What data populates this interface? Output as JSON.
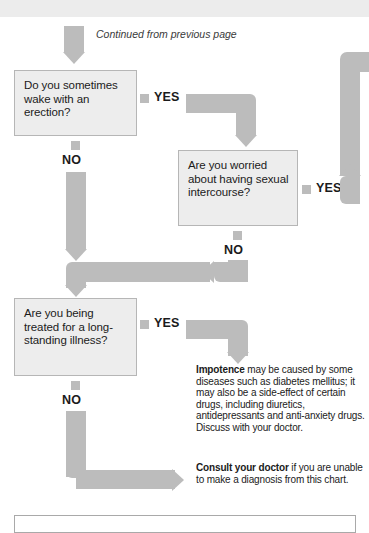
{
  "page": {
    "continued_note": "Continued from previous page"
  },
  "questions": [
    {
      "id": "wake-erection",
      "text": "Do you sometimes wake with an erection?",
      "yes_label": "YES",
      "no_label": "NO"
    },
    {
      "id": "worried-intercourse",
      "text": "Are you worried about having sexual intercourse?",
      "yes_label": "YES",
      "no_label": "NO"
    },
    {
      "id": "long-standing-illness",
      "text": "Are you being treated for a long-standing illness?",
      "yes_label": "YES",
      "no_label": "NO"
    }
  ],
  "advice": [
    {
      "id": "impotence",
      "lead": "Impotence",
      "body": " may be caused by some diseases such as diabetes mellitus; it may also be a side-effect of certain drugs, including diuretics, antidepressants and anti-anxiety drugs.  Discuss with your doctor."
    },
    {
      "id": "consult-doctor",
      "lead": "Consult your doctor",
      "body": " if you are unable to make a diagnosis from this chart."
    }
  ],
  "colors": {
    "arrow": "#bcbcbc",
    "box_fill": "#ededed",
    "box_border": "#b6b6b6",
    "text": "#1b1b1b",
    "top_band": "#ececec"
  }
}
